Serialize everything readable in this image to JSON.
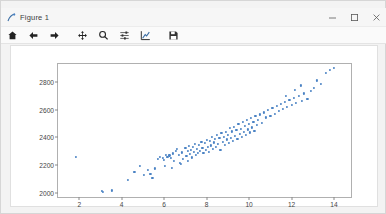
{
  "window": {
    "title": "Figure 1",
    "app_icon": "matplotlib-figure-icon",
    "controls": [
      {
        "name": "minimize-button",
        "glyph": "minimize-icon"
      },
      {
        "name": "maximize-button",
        "glyph": "maximize-icon"
      },
      {
        "name": "close-button",
        "glyph": "close-icon"
      }
    ]
  },
  "toolbar": {
    "buttons": [
      {
        "name": "home-button",
        "icon": "home-icon",
        "tooltip": "Reset original view"
      },
      {
        "name": "back-button",
        "icon": "arrow-left-icon",
        "tooltip": "Back to previous view"
      },
      {
        "name": "forward-button",
        "icon": "arrow-right-icon",
        "tooltip": "Forward to next view"
      },
      {
        "name": "pan-button",
        "icon": "move-cross-arrows-icon",
        "tooltip": "Pan axes with left mouse, zoom with right"
      },
      {
        "name": "zoom-button",
        "icon": "magnifier-icon",
        "tooltip": "Zoom to rectangle"
      },
      {
        "name": "subplots-button",
        "icon": "sliders-icon",
        "tooltip": "Configure subplots"
      },
      {
        "name": "customize-button",
        "icon": "curve-axes-icon",
        "tooltip": "Edit axis, curve and image parameters"
      },
      {
        "name": "save-button",
        "icon": "floppy-disk-icon",
        "tooltip": "Save the figure"
      }
    ]
  },
  "chart_data": {
    "type": "scatter",
    "title": "",
    "xlabel": "",
    "ylabel": "",
    "xlim": [
      1.0,
      14.8
    ],
    "ylim": [
      1970,
      2930
    ],
    "xticks": [
      2,
      4,
      6,
      8,
      10,
      12,
      14
    ],
    "yticks": [
      2000,
      2200,
      2400,
      2600,
      2800
    ],
    "grid": false,
    "legend": null,
    "marker_color": "#4a82c4",
    "marker_size": 2.2,
    "points": [
      [
        1.85,
        2262
      ],
      [
        3.05,
        2012
      ],
      [
        3.1,
        2005
      ],
      [
        3.55,
        2018
      ],
      [
        4.6,
        2150
      ],
      [
        4.85,
        2196
      ],
      [
        5.05,
        2128
      ],
      [
        5.25,
        2163
      ],
      [
        5.45,
        2108
      ],
      [
        5.7,
        2245
      ],
      [
        5.8,
        2262
      ],
      [
        5.95,
        2252
      ],
      [
        6.0,
        2238
      ],
      [
        6.1,
        2272
      ],
      [
        6.15,
        2258
      ],
      [
        6.25,
        2270
      ],
      [
        6.3,
        2250
      ],
      [
        6.4,
        2284
      ],
      [
        6.45,
        2228
      ],
      [
        6.55,
        2300
      ],
      [
        6.6,
        2318
      ],
      [
        6.7,
        2272
      ],
      [
        6.75,
        2214
      ],
      [
        6.85,
        2292
      ],
      [
        6.9,
        2246
      ],
      [
        7.0,
        2324
      ],
      [
        7.05,
        2268
      ],
      [
        7.1,
        2300
      ],
      [
        7.15,
        2340
      ],
      [
        7.2,
        2282
      ],
      [
        7.25,
        2312
      ],
      [
        7.3,
        2256
      ],
      [
        7.35,
        2330
      ],
      [
        7.4,
        2296
      ],
      [
        7.45,
        2352
      ],
      [
        7.5,
        2274
      ],
      [
        7.55,
        2318
      ],
      [
        7.6,
        2288
      ],
      [
        7.65,
        2344
      ],
      [
        7.7,
        2302
      ],
      [
        7.75,
        2366
      ],
      [
        7.8,
        2324
      ],
      [
        7.85,
        2290
      ],
      [
        7.9,
        2358
      ],
      [
        7.95,
        2312
      ],
      [
        8.0,
        2380
      ],
      [
        8.05,
        2334
      ],
      [
        8.1,
        2298
      ],
      [
        8.15,
        2372
      ],
      [
        8.2,
        2342
      ],
      [
        8.25,
        2406
      ],
      [
        8.3,
        2318
      ],
      [
        8.35,
        2364
      ],
      [
        8.4,
        2390
      ],
      [
        8.45,
        2330
      ],
      [
        8.5,
        2418
      ],
      [
        8.55,
        2356
      ],
      [
        8.6,
        2398
      ],
      [
        8.65,
        2312
      ],
      [
        8.7,
        2432
      ],
      [
        8.75,
        2370
      ],
      [
        8.8,
        2404
      ],
      [
        8.85,
        2348
      ],
      [
        8.9,
        2440
      ],
      [
        8.95,
        2386
      ],
      [
        9.0,
        2420
      ],
      [
        9.05,
        2358
      ],
      [
        9.1,
        2466
      ],
      [
        9.15,
        2398
      ],
      [
        9.2,
        2444
      ],
      [
        9.25,
        2374
      ],
      [
        9.3,
        2478
      ],
      [
        9.35,
        2412
      ],
      [
        9.4,
        2452
      ],
      [
        9.45,
        2392
      ],
      [
        9.5,
        2496
      ],
      [
        9.55,
        2428
      ],
      [
        9.6,
        2464
      ],
      [
        9.65,
        2406
      ],
      [
        9.7,
        2510
      ],
      [
        9.75,
        2442
      ],
      [
        9.8,
        2482
      ],
      [
        9.85,
        2418
      ],
      [
        9.9,
        2524
      ],
      [
        9.95,
        2458
      ],
      [
        10.0,
        2498
      ],
      [
        10.05,
        2436
      ],
      [
        10.1,
        2540
      ],
      [
        10.15,
        2472
      ],
      [
        10.2,
        2514
      ],
      [
        10.25,
        2450
      ],
      [
        10.3,
        2556
      ],
      [
        10.35,
        2488
      ],
      [
        10.4,
        2528
      ],
      [
        10.5,
        2566
      ],
      [
        10.6,
        2504
      ],
      [
        10.7,
        2580
      ],
      [
        10.8,
        2544
      ],
      [
        10.9,
        2596
      ],
      [
        11.0,
        2558
      ],
      [
        11.1,
        2612
      ],
      [
        11.2,
        2572
      ],
      [
        11.3,
        2628
      ],
      [
        11.4,
        2590
      ],
      [
        11.5,
        2640
      ],
      [
        11.6,
        2604
      ],
      [
        11.7,
        2656
      ],
      [
        11.8,
        2618
      ],
      [
        11.9,
        2672
      ],
      [
        12.0,
        2634
      ],
      [
        12.1,
        2688
      ],
      [
        12.2,
        2650
      ],
      [
        12.35,
        2702
      ],
      [
        12.5,
        2666
      ],
      [
        12.6,
        2718
      ],
      [
        12.75,
        2680
      ],
      [
        12.9,
        2734
      ],
      [
        13.05,
        2758
      ],
      [
        13.2,
        2812
      ],
      [
        13.4,
        2786
      ],
      [
        13.6,
        2866
      ],
      [
        13.8,
        2888
      ],
      [
        14.0,
        2902
      ],
      [
        6.05,
        2196
      ],
      [
        6.35,
        2182
      ],
      [
        6.8,
        2208
      ],
      [
        7.12,
        2232
      ],
      [
        5.55,
        2176
      ],
      [
        5.35,
        2134
      ],
      [
        4.3,
        2096
      ],
      [
        12.15,
        2742
      ],
      [
        12.45,
        2776
      ],
      [
        11.75,
        2700
      ]
    ]
  }
}
